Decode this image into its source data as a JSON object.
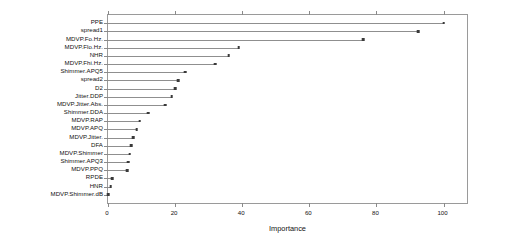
{
  "chart_data": {
    "type": "bar",
    "subtype": "lollipop-horizontal",
    "title": "",
    "xlabel": "Importance",
    "ylabel": "",
    "xlim": [
      0,
      107
    ],
    "ylim": [
      0,
      22
    ],
    "xticks": [
      0,
      20,
      40,
      60,
      80,
      100
    ],
    "xtick_labels": [
      "0",
      "20",
      "40",
      "60",
      "80",
      "100"
    ],
    "grid": false,
    "legend": false,
    "orientation": "horizontal",
    "categories": [
      "PPE",
      "spread1",
      "MDVP.Fo.Hz.",
      "MDVP.Flo.Hz.",
      "NHR",
      "MDVP.Fhi.Hz.",
      "Shimmer.APQ5",
      "spread2",
      "D2",
      "Jitter.DDP",
      "MDVP.Jitter.Abs.",
      "Shimmer.DDA",
      "MDVP.RAP",
      "MDVP.APQ",
      "MDVP.Jitter.",
      "DFA",
      "MDVP.Shimmer",
      "Shimmer.APQ3",
      "MDVP.PPQ",
      "RPDE",
      "HNR",
      "MDVP.Shimmer.dB"
    ],
    "values": [
      100.0,
      92.5,
      76.0,
      39.0,
      36.0,
      32.0,
      23.0,
      21.0,
      20.0,
      19.0,
      17.0,
      12.0,
      9.5,
      8.5,
      7.5,
      7.0,
      6.5,
      6.0,
      5.7,
      1.2,
      0.8,
      0.0
    ],
    "series_name": "Importance",
    "colors": {
      "stem": "#8f8f8f",
      "dot": "#3a3a3a",
      "axis": "#9a9a9a",
      "text": "#111111",
      "background": "#ffffff"
    }
  }
}
